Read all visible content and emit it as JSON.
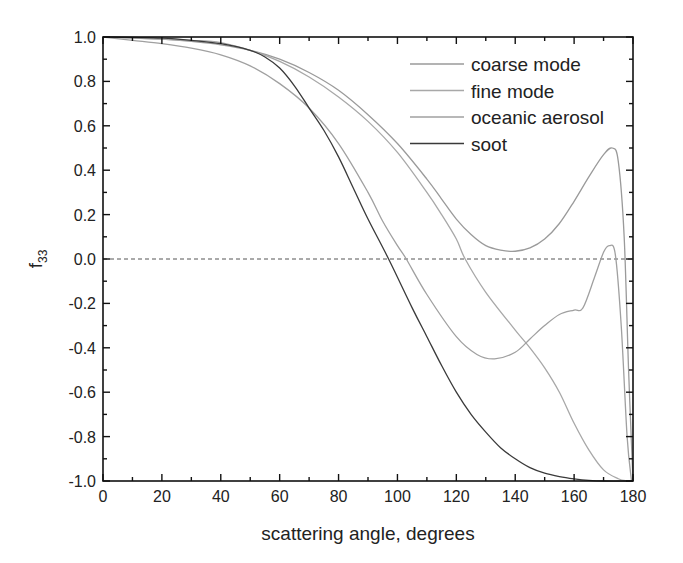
{
  "chart_data": {
    "type": "line",
    "title": "",
    "xlabel": "scattering angle, degrees",
    "ylabel": "f",
    "ylabel_subscript": "33",
    "xlim": [
      0,
      180
    ],
    "ylim": [
      -1.0,
      1.0
    ],
    "xticks": [
      0,
      20,
      40,
      60,
      80,
      100,
      120,
      140,
      160,
      180
    ],
    "xtick_labels": [
      "0",
      "20",
      "40",
      "60",
      "80",
      "100",
      "120",
      "140",
      "160",
      "180"
    ],
    "xminor_step": 10,
    "yticks": [
      -1.0,
      -0.8,
      -0.6,
      -0.4,
      -0.2,
      0.0,
      0.2,
      0.4,
      0.6,
      0.8,
      1.0
    ],
    "ytick_labels": [
      "-1.0",
      "-0.8",
      "-0.6",
      "-0.4",
      "-0.2",
      "0.0",
      "0.2",
      "0.4",
      "0.6",
      "0.8",
      "1.0"
    ],
    "yminor_step": 0.1,
    "grid": false,
    "reference_line": {
      "y": 0.0,
      "style": "dashed"
    },
    "legend_position": "upper right",
    "series": [
      {
        "name": "coarse mode",
        "color": "#9a9a9a",
        "x": [
          0,
          10,
          20,
          30,
          40,
          50,
          60,
          70,
          80,
          90,
          100,
          110,
          115,
          120,
          125,
          130,
          135,
          140,
          145,
          150,
          155,
          160,
          165,
          170,
          173,
          175,
          177,
          178.5,
          180
        ],
        "y": [
          1.0,
          0.995,
          0.99,
          0.98,
          0.965,
          0.94,
          0.9,
          0.84,
          0.76,
          0.65,
          0.52,
          0.36,
          0.27,
          0.18,
          0.11,
          0.06,
          0.04,
          0.035,
          0.05,
          0.09,
          0.16,
          0.26,
          0.37,
          0.47,
          0.5,
          0.44,
          0.1,
          -0.5,
          -1.0
        ]
      },
      {
        "name": "fine mode",
        "color": "#a8a8a8",
        "x": [
          0,
          10,
          20,
          30,
          40,
          50,
          60,
          70,
          80,
          90,
          100,
          110,
          115,
          120,
          123,
          130,
          140,
          145,
          150,
          155,
          160,
          165,
          170,
          175,
          178
        ],
        "y": [
          1.0,
          0.995,
          0.99,
          0.985,
          0.975,
          0.94,
          0.89,
          0.82,
          0.73,
          0.62,
          0.48,
          0.3,
          0.2,
          0.09,
          0.0,
          -0.15,
          -0.32,
          -0.4,
          -0.49,
          -0.6,
          -0.74,
          -0.86,
          -0.95,
          -0.99,
          -1.0
        ]
      },
      {
        "name": "oceanic aerosol",
        "color": "#a0a0a0",
        "x": [
          0,
          10,
          20,
          30,
          40,
          50,
          60,
          70,
          80,
          90,
          95,
          100,
          103,
          110,
          120,
          127,
          133,
          140,
          145,
          150,
          155,
          160,
          163,
          167,
          170,
          172,
          174,
          176,
          178,
          179.5
        ],
        "y": [
          1.0,
          0.985,
          0.97,
          0.95,
          0.92,
          0.87,
          0.79,
          0.68,
          0.52,
          0.3,
          0.17,
          0.06,
          0.0,
          -0.16,
          -0.35,
          -0.43,
          -0.45,
          -0.42,
          -0.36,
          -0.3,
          -0.25,
          -0.23,
          -0.22,
          -0.08,
          0.03,
          0.06,
          0.02,
          -0.3,
          -0.8,
          -1.0
        ]
      },
      {
        "name": "soot",
        "color": "#3a3a3a",
        "x": [
          0,
          10,
          20,
          30,
          40,
          50,
          55,
          60,
          65,
          70,
          75,
          80,
          85,
          90,
          97,
          105,
          110,
          115,
          120,
          125,
          130,
          135,
          140,
          145,
          150,
          155,
          160,
          165,
          170,
          180
        ],
        "y": [
          1.0,
          0.998,
          0.995,
          0.985,
          0.97,
          0.94,
          0.91,
          0.86,
          0.78,
          0.68,
          0.58,
          0.46,
          0.32,
          0.18,
          0.0,
          -0.22,
          -0.35,
          -0.48,
          -0.6,
          -0.7,
          -0.78,
          -0.85,
          -0.9,
          -0.94,
          -0.965,
          -0.98,
          -0.99,
          -0.997,
          -1.0,
          -1.0
        ]
      }
    ]
  }
}
